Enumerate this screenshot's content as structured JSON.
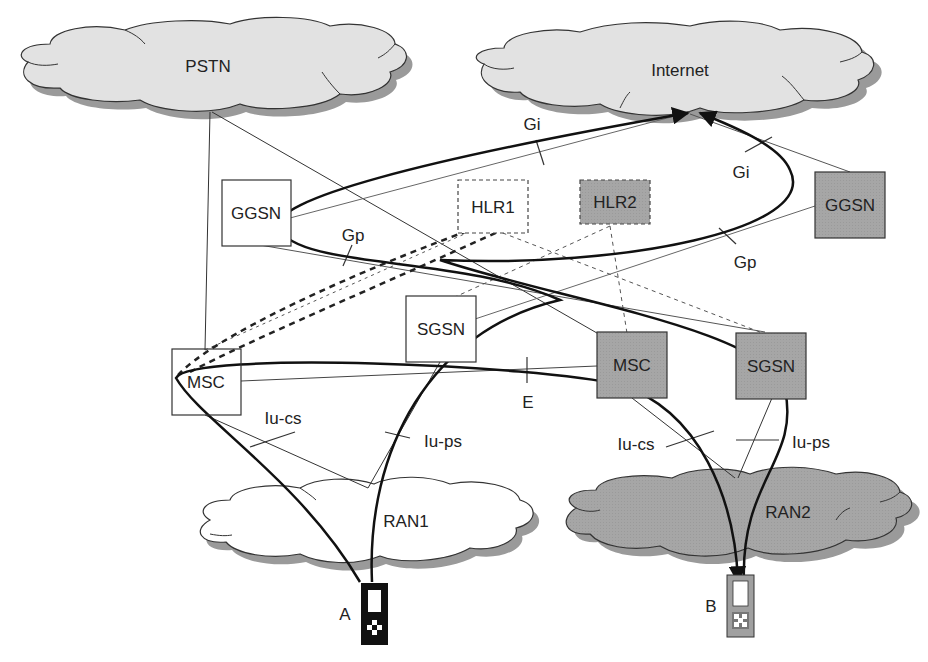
{
  "diagram": {
    "colors": {
      "home_fill": "#ffffff",
      "visited_fill": "#a8a8a8",
      "cloud_light": "#e2e2e2",
      "cloud_shadow": "#9a9a9a",
      "line": "#333333",
      "path": "#111111"
    },
    "clouds": {
      "pstn": "PSTN",
      "internet": "Internet",
      "ran1": "RAN1",
      "ran2": "RAN2"
    },
    "nodes": {
      "ggsn1": "GGSN",
      "hlr1": "HLR1",
      "hlr2": "HLR2",
      "ggsn2": "GGSN",
      "sgsn1": "SGSN",
      "msc1": "MSC",
      "msc2": "MSC",
      "sgsn2": "SGSN"
    },
    "interfaces": {
      "gi_left": "Gi",
      "gi_right": "Gi",
      "gp_left": "Gp",
      "gp_right": "Gp",
      "e": "E",
      "iu_cs_left": "Iu-cs",
      "iu_ps_left": "Iu-ps",
      "iu_cs_right": "Iu-cs",
      "iu_ps_right": "Iu-ps"
    },
    "terminals": {
      "a": "A",
      "b": "B"
    }
  }
}
